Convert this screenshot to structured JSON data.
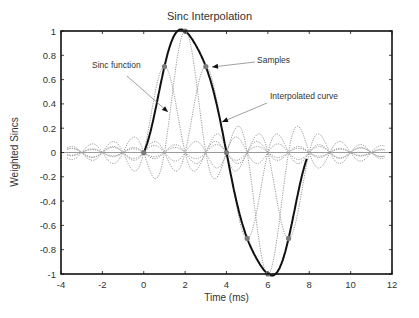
{
  "chart_data": {
    "type": "line",
    "title": "Sinc Interpolation",
    "xlabel": "Time (ms)",
    "ylabel": "Weighted Sincs",
    "xlim": [
      -4,
      12
    ],
    "ylim": [
      -1,
      1
    ],
    "xticks": [
      -4,
      -2,
      0,
      2,
      4,
      6,
      8,
      10,
      12
    ],
    "yticks": [
      1,
      0.8,
      0.6,
      0.4,
      0.2,
      0,
      -0.2,
      -0.4,
      -0.6,
      -0.8,
      -1
    ],
    "ytick_labels": [
      "1",
      "0.8",
      "0.6",
      "0.4",
      "0.2",
      "0",
      "-0.2",
      "-0.4",
      "-0.6",
      "-0.8",
      "-1"
    ],
    "grid": false,
    "samples": {
      "name": "Samples",
      "x": [
        0,
        1,
        2,
        3,
        4,
        5,
        6,
        7
      ],
      "y": [
        0,
        0.707,
        1,
        0.707,
        0,
        -0.707,
        -1,
        -0.707
      ]
    },
    "series": [
      {
        "name": "Interpolated curve",
        "style": "solid",
        "x_range": [
          0,
          7.9
        ],
        "description": "sum of weighted sincs through samples"
      },
      {
        "name": "Sinc function",
        "style": "dotted",
        "description": "one weighted sinc per sample, centered at each sample time"
      }
    ],
    "annotations": [
      {
        "text": "Sinc function",
        "points_to": "weighted sinc near t=1"
      },
      {
        "text": "Samples",
        "points_to": "sample at t=3"
      },
      {
        "text": "Interpolated curve",
        "points_to": "solid curve near t=3.6"
      }
    ],
    "colors": {
      "curve": "#111111",
      "sinc": "#9a9a9a",
      "sample": "#7a7a7a",
      "zero_line": "#9a9a9a",
      "axes": "#111111"
    }
  }
}
